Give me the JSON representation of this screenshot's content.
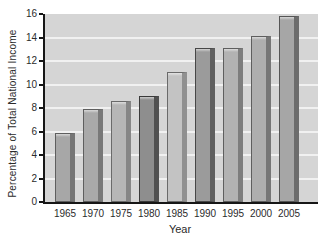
{
  "chart_data": {
    "type": "bar",
    "title": "",
    "xlabel": "Year",
    "ylabel": "Percentage of Total National Income",
    "categories": [
      "1965",
      "1970",
      "1975",
      "1980",
      "1985",
      "1990",
      "1995",
      "2000",
      "2005"
    ],
    "values": [
      5.9,
      7.9,
      8.6,
      9.0,
      11.1,
      13.1,
      13.1,
      14.1,
      15.8
    ],
    "ylim": [
      0,
      16
    ],
    "ytick_step": 2,
    "ytick_labels": [
      "0",
      "2",
      "4",
      "6",
      "8",
      "10",
      "12",
      "14",
      "16"
    ],
    "grid": "horizontal white gridlines on gray plot background",
    "legend": "none",
    "colors": {
      "plot_background": "#d5d5d5",
      "gridline": "#f1f1f1",
      "axis": "#161616",
      "text": "#2b2b2b"
    },
    "bar_styles": [
      {
        "face": "#a7a7a7",
        "side": "#757575",
        "edge": "#5e5e5e"
      },
      {
        "face": "#a9a9a9",
        "side": "#787878",
        "edge": "#5e5e5e"
      },
      {
        "face": "#b6b6b6",
        "side": "#868686",
        "edge": "#6a6a6a"
      },
      {
        "face": "#8e8e8e",
        "side": "#515151",
        "edge": "#3a3a3a"
      },
      {
        "face": "#c3c3c3",
        "side": "#909090",
        "edge": "#6a6a6a"
      },
      {
        "face": "#9b9b9b",
        "side": "#606060",
        "edge": "#474747"
      },
      {
        "face": "#b2b2b2",
        "side": "#7d7d7d",
        "edge": "#5e5e5e"
      },
      {
        "face": "#aeaeae",
        "side": "#767676",
        "edge": "#5e5e5e"
      },
      {
        "face": "#a6a6a6",
        "side": "#6c6c6c",
        "edge": "#555555"
      }
    ]
  }
}
